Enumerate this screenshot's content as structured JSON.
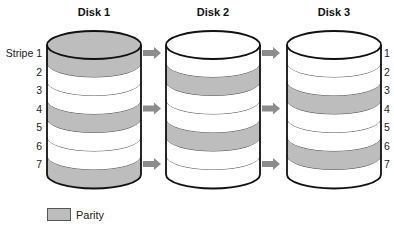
{
  "diagram": {
    "stripe_prefix": "Stripe",
    "stripes": [
      "1",
      "2",
      "3",
      "4",
      "5",
      "6",
      "7"
    ],
    "colors": {
      "parity_fill": "#bdbdbd",
      "data_fill": "#ffffff",
      "outline": "#111111",
      "arrow": "#8c8c8c"
    },
    "disks": [
      {
        "name": "Disk 1",
        "parity_stripes": [
          1,
          4,
          7
        ],
        "top_parity": true
      },
      {
        "name": "Disk 2",
        "parity_stripes": [
          2,
          5
        ],
        "top_parity": false
      },
      {
        "name": "Disk 3",
        "parity_stripes": [
          3,
          6
        ],
        "top_parity": false
      }
    ],
    "arrows": [
      {
        "from": "Disk 1",
        "to": "Disk 2",
        "rows": [
          1,
          4,
          7
        ]
      },
      {
        "from": "Disk 2",
        "to": "Disk 3",
        "rows": [
          1,
          4,
          7
        ]
      }
    ],
    "left_labels": [
      "Stripe 1",
      "2",
      "3",
      "4",
      "5",
      "6",
      "7"
    ],
    "right_labels": [
      "1",
      "2",
      "3",
      "4",
      "5",
      "6",
      "7"
    ]
  },
  "legend": {
    "items": [
      {
        "label": "Parity",
        "color": "#bdbdbd"
      }
    ]
  }
}
